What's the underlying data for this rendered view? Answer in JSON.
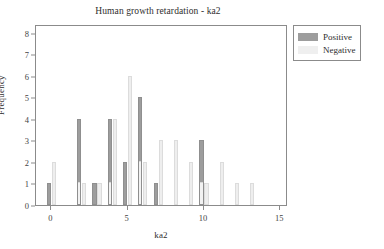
{
  "chart_data": {
    "type": "bar",
    "title": "Human growth retardation - ka2",
    "xlabel": "ka2",
    "ylabel": "Frequency",
    "xlim": [
      -1,
      15.5
    ],
    "ylim": [
      0,
      8.4
    ],
    "xticks": [
      0,
      5,
      10,
      15
    ],
    "yticks": [
      0,
      1,
      2,
      3,
      4,
      5,
      6,
      7,
      8
    ],
    "grid": false,
    "legend_position": "outside-top-right",
    "categories": [
      0,
      1,
      2,
      3,
      4,
      5,
      6,
      7,
      8,
      9,
      10,
      11,
      12,
      13
    ],
    "series": [
      {
        "name": "Positive",
        "color": "#9d9d9d",
        "values": [
          1,
          0,
          4,
          1,
          4,
          2,
          5,
          1,
          0,
          0,
          3,
          0,
          0,
          0
        ]
      },
      {
        "name": "Negative",
        "color": "#efefef",
        "values": [
          2,
          0,
          1,
          1,
          4,
          6,
          2,
          3,
          3,
          2,
          1,
          2,
          1,
          1
        ]
      }
    ]
  },
  "legend": {
    "entries": [
      {
        "label": "Positive",
        "swatch": "positive"
      },
      {
        "label": "Negative",
        "swatch": "negative"
      }
    ]
  }
}
